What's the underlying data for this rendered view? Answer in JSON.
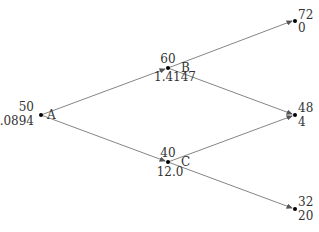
{
  "diagram": {
    "type": "binomial-tree",
    "nodes": [
      {
        "id": "A",
        "name": "A",
        "value": "50",
        "sub": "5.0894",
        "x": 41,
        "y": 115
      },
      {
        "id": "B",
        "name": "B",
        "value": "60",
        "sub": "1.4147",
        "x": 168,
        "y": 68
      },
      {
        "id": "C",
        "name": "C",
        "value": "40",
        "sub": "12.0",
        "x": 168,
        "y": 162
      },
      {
        "id": "T1",
        "name": "",
        "value": "72",
        "sub": "0",
        "x": 295,
        "y": 20
      },
      {
        "id": "T2",
        "name": "",
        "value": "48",
        "sub": "4",
        "x": 295,
        "y": 115
      },
      {
        "id": "T3",
        "name": "",
        "value": "32",
        "sub": "20",
        "x": 295,
        "y": 209
      }
    ],
    "edges": [
      {
        "from": "A",
        "to": "B"
      },
      {
        "from": "A",
        "to": "C"
      },
      {
        "from": "B",
        "to": "T1"
      },
      {
        "from": "B",
        "to": "T2"
      },
      {
        "from": "C",
        "to": "T2"
      },
      {
        "from": "C",
        "to": "T3"
      }
    ]
  }
}
